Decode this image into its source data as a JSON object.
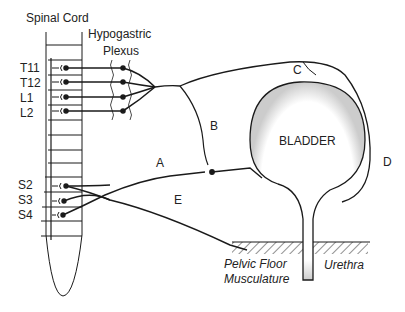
{
  "diagram": {
    "title_labels": {
      "spinal_cord": "Spinal Cord",
      "hypogastric_1": "Hypogastric",
      "hypogastric_2": "Plexus"
    },
    "segments": [
      "T11",
      "T12",
      "L1",
      "L2",
      "S2",
      "S3",
      "S4"
    ],
    "nerve_labels": {
      "A": "A",
      "B": "B",
      "C": "C",
      "D": "D",
      "E": "E"
    },
    "organ": "BLADDER",
    "bottom_labels": {
      "pelvic_1": "Pelvic Floor",
      "pelvic_2": "Musculature",
      "urethra": "Urethra"
    },
    "colors": {
      "line": "#1a1a1a",
      "stipple": "#888888"
    }
  }
}
